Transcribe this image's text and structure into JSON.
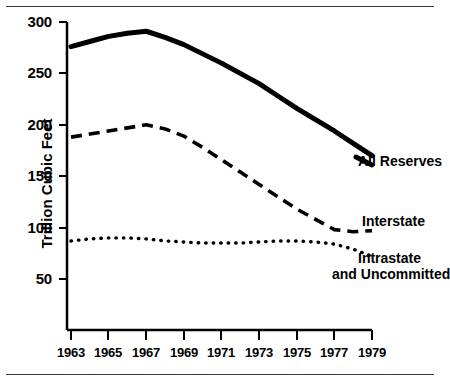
{
  "chart_data": {
    "type": "line",
    "title": "",
    "xlabel": "",
    "ylabel": "Trillion Cubic Feet",
    "xlim": [
      1963,
      1979
    ],
    "ylim": [
      0,
      300
    ],
    "xticks": [
      1963,
      1965,
      1967,
      1969,
      1971,
      1973,
      1975,
      1977,
      1979
    ],
    "yticks": [
      50,
      100,
      150,
      200,
      250,
      300
    ],
    "grid": false,
    "legend_position": "right-inline-labels",
    "x": [
      1963,
      1964,
      1965,
      1966,
      1967,
      1968,
      1969,
      1970,
      1971,
      1972,
      1973,
      1974,
      1975,
      1976,
      1977,
      1978,
      1979
    ],
    "series": [
      {
        "name": "All Reserves",
        "style": "solid",
        "color": "#000000",
        "values": [
          276,
          281,
          286,
          289,
          291,
          285,
          278,
          269,
          260,
          250,
          240,
          228,
          216,
          205,
          194,
          182,
          170
        ]
      },
      {
        "name": "Interstate",
        "style": "dashed",
        "color": "#000000",
        "values": [
          188,
          191,
          194,
          197,
          200,
          196,
          189,
          178,
          166,
          154,
          142,
          130,
          118,
          108,
          98,
          96,
          97
        ]
      },
      {
        "name": "Intrastate and Uncommitted",
        "style": "dotted",
        "color": "#000000",
        "values": [
          87,
          89,
          90,
          90,
          89,
          87,
          86,
          85,
          85,
          85,
          86,
          87,
          87,
          86,
          84,
          79,
          72
        ]
      }
    ]
  },
  "axes": {
    "y_label": "Trillion Cubic Feet",
    "y_tick_labels": [
      "300",
      "250",
      "200",
      "150",
      "100",
      "50"
    ],
    "x_tick_labels": [
      "1963",
      "1965",
      "1967",
      "1969",
      "1971",
      "1973",
      "1975",
      "1977",
      "1979"
    ]
  },
  "series_labels": {
    "all_reserves": "All Reserves",
    "interstate": "Interstate",
    "intrastate_line1": "Intrastate",
    "intrastate_line2": "and Uncommitted"
  }
}
